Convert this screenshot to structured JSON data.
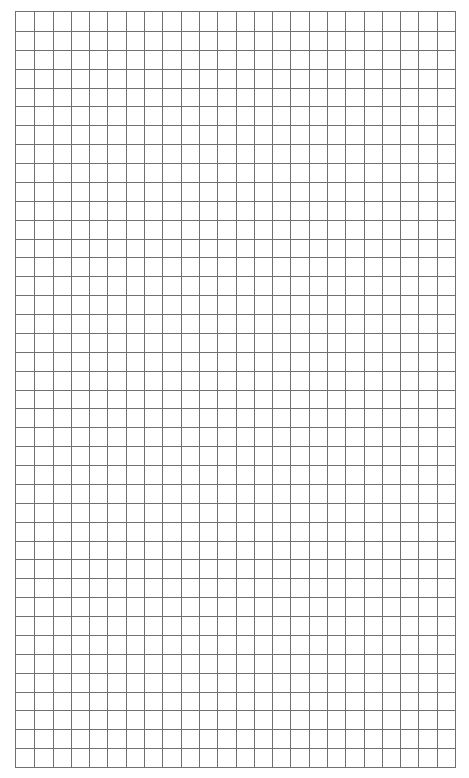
{
  "page": {
    "type": "graph-paper",
    "background_color": "#ffffff",
    "line_color": "#707070"
  },
  "grid": {
    "columns": 24,
    "rows": 40,
    "left": 15,
    "top": 11,
    "width": 441,
    "height": 757
  }
}
